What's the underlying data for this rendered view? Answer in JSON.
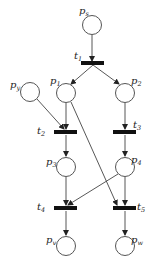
{
  "diagram": {
    "type": "petri-net",
    "places": [
      {
        "id": "ps",
        "label": "p",
        "sub": "s",
        "cx": 92,
        "cy": 25
      },
      {
        "id": "p1",
        "label": "p",
        "sub": "1",
        "cx": 66,
        "cy": 93
      },
      {
        "id": "p2",
        "label": "p",
        "sub": "2",
        "cx": 125,
        "cy": 93
      },
      {
        "id": "py",
        "label": "p",
        "sub": "y",
        "cx": 30,
        "cy": 92
      },
      {
        "id": "p3",
        "label": "p",
        "sub": "3",
        "cx": 66,
        "cy": 167
      },
      {
        "id": "p4",
        "label": "p",
        "sub": "4",
        "cx": 125,
        "cy": 167
      },
      {
        "id": "pv",
        "label": "p",
        "sub": "v",
        "cx": 66,
        "cy": 246
      },
      {
        "id": "pw",
        "label": "p",
        "sub": "w",
        "cx": 125,
        "cy": 246
      }
    ],
    "transitions": [
      {
        "id": "t1",
        "label": "t",
        "sub": "1",
        "x": 82,
        "y": 63
      },
      {
        "id": "t2",
        "label": "t",
        "sub": "2",
        "x": 54,
        "y": 132
      },
      {
        "id": "t3",
        "label": "t",
        "sub": "3",
        "x": 113,
        "y": 132
      },
      {
        "id": "t4",
        "label": "t",
        "sub": "4",
        "x": 54,
        "y": 208
      },
      {
        "id": "t5",
        "label": "t",
        "sub": "5",
        "x": 113,
        "y": 208
      }
    ],
    "arcs": [
      [
        "ps",
        "t1"
      ],
      [
        "t1",
        "p1"
      ],
      [
        "t1",
        "p2"
      ],
      [
        "p1",
        "t2"
      ],
      [
        "py",
        "t2"
      ],
      [
        "p2",
        "t3"
      ],
      [
        "t2",
        "p3"
      ],
      [
        "t3",
        "p4"
      ],
      [
        "p3",
        "t4"
      ],
      [
        "p4",
        "t4"
      ],
      [
        "p1",
        "t5"
      ],
      [
        "p4",
        "t5"
      ],
      [
        "t4",
        "pv"
      ],
      [
        "t5",
        "pw"
      ]
    ],
    "labels": {
      "ps": "s",
      "p1": "1",
      "p2": "2",
      "py": "y",
      "p3": "3",
      "p4": "4",
      "pv": "v",
      "pw": "w",
      "t1": "1",
      "t2": "2",
      "t3": "3",
      "t4": "4",
      "t5": "5",
      "p": "p",
      "t": "t"
    }
  }
}
